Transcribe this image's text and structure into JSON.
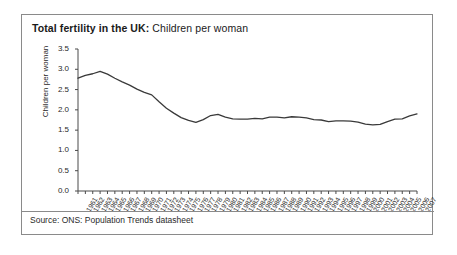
{
  "figure": {
    "title_strong": "Total fertility in the UK:",
    "title_rest": " Children per woman",
    "source": "Source: ONS: Population Trends datasheet",
    "border_color": "#8a8a8a",
    "line_color": "#3a3a3a",
    "background": "#ffffff"
  },
  "chart_data": {
    "type": "line",
    "title": "Total fertility in the UK: Children per woman",
    "xlabel": "",
    "ylabel": "Children per woman",
    "ylim": [
      0.0,
      3.5
    ],
    "yticks": [
      "0.0",
      "0.5",
      "1.0",
      "1.5",
      "2.0",
      "2.5",
      "3.0",
      "3.5"
    ],
    "ytick_values": [
      0.0,
      0.5,
      1.0,
      1.5,
      2.0,
      2.5,
      3.0,
      3.5
    ],
    "grid": false,
    "legend": "none",
    "categories": [
      "1961",
      "1962",
      "1963",
      "1964",
      "1965",
      "1966",
      "1967",
      "1968",
      "1969",
      "1970",
      "1971",
      "1972",
      "1973",
      "1974",
      "1975",
      "1976",
      "1977",
      "1978",
      "1979",
      "1980",
      "1981",
      "1982",
      "1983",
      "1984",
      "1985",
      "1986",
      "1987",
      "1988",
      "1989",
      "1990",
      "1991",
      "1992",
      "1993",
      "1994",
      "1995",
      "1996",
      "1997",
      "1998",
      "1999",
      "2000",
      "2001",
      "2002",
      "2003",
      "2004",
      "2005",
      "2006",
      "2007"
    ],
    "values": [
      2.78,
      2.85,
      2.89,
      2.95,
      2.88,
      2.78,
      2.69,
      2.61,
      2.51,
      2.43,
      2.37,
      2.2,
      2.04,
      1.92,
      1.81,
      1.74,
      1.69,
      1.76,
      1.86,
      1.89,
      1.82,
      1.78,
      1.77,
      1.77,
      1.79,
      1.78,
      1.82,
      1.82,
      1.8,
      1.83,
      1.82,
      1.8,
      1.76,
      1.75,
      1.71,
      1.73,
      1.73,
      1.72,
      1.7,
      1.65,
      1.63,
      1.64,
      1.71,
      1.77,
      1.78,
      1.85,
      1.9
    ]
  }
}
